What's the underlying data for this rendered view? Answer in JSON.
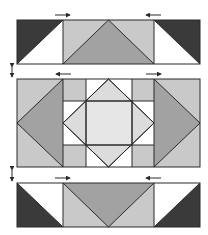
{
  "diagram": {
    "colors": {
      "dark": "#3a3a3a",
      "medium": "#a2a2a2",
      "light": "#c9c9c9",
      "pale": "#dcdcdc",
      "center": "#e6e6e6",
      "white": "#ffffff",
      "line": "#2a2a2a"
    },
    "rows": [
      {
        "name": "top-row",
        "pressing": [
          "right",
          "left"
        ]
      },
      {
        "name": "middle-row",
        "pressing": [
          "left",
          "right"
        ]
      },
      {
        "name": "bottom-row",
        "pressing": [
          "right",
          "left"
        ]
      }
    ],
    "row_join_indicators": [
      "double-arrow-between-top-and-middle",
      "double-arrow-between-middle-and-bottom"
    ]
  }
}
